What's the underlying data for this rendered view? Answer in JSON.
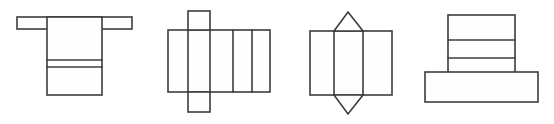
{
  "canvas": {
    "width": 554,
    "height": 124,
    "background_color": "#ffffff",
    "stroke_color": "#3c3c3c",
    "stroke_width": 1.6,
    "fill_color": "#fefefe",
    "description": "Row of four black-and-white line-drawn geometric nets (unfolded solids) on a plain white background. No text, labels, axes or numbers appear anywhere in the image."
  },
  "figures": [
    {
      "id": "figure-1",
      "name": "t-shaped-net",
      "label": "",
      "position_index": 1,
      "shape_type": "t-shape-net",
      "description": "A wide thin horizontal bar across the top with a tall vertical rectangle hanging from its middle, forming a T. The vertical rectangle is split by two closely spaced horizontal lines near its lower third.",
      "bounds": {
        "x": 17,
        "y": 17,
        "width": 115,
        "height": 79
      },
      "parts": [
        {
          "name": "top-horizontal-bar",
          "type": "rectangle",
          "x": 17,
          "y": 17,
          "width": 115,
          "height": 12
        },
        {
          "name": "vertical-body",
          "type": "rectangle",
          "x": 47,
          "y": 17,
          "width": 55,
          "height": 78
        }
      ],
      "divider_lines": [
        {
          "name": "body-divider-upper",
          "orientation": "horizontal",
          "x1": 47,
          "y1": 60,
          "x2": 102,
          "y2": 60
        },
        {
          "name": "body-divider-lower",
          "orientation": "horizontal",
          "x1": 47,
          "y1": 67,
          "x2": 102,
          "y2": 67
        }
      ]
    },
    {
      "id": "figure-2",
      "name": "box-net-with-flaps",
      "label": "",
      "position_index": 2,
      "shape_type": "rectangular-prism-net",
      "description": "A wide rectangle divided by four vertical lines into five panels, with one square flap projecting above and one square flap projecting below, both aligned with the second panel.",
      "bounds": {
        "x": 168,
        "y": 11,
        "width": 102,
        "height": 101
      },
      "parts": [
        {
          "name": "main-strip",
          "type": "rectangle",
          "x": 168,
          "y": 30,
          "width": 102,
          "height": 62
        },
        {
          "name": "top-flap-square",
          "type": "rectangle",
          "x": 188,
          "y": 11,
          "width": 22,
          "height": 19
        },
        {
          "name": "bottom-flap-square",
          "type": "rectangle",
          "x": 188,
          "y": 92,
          "width": 22,
          "height": 20
        }
      ],
      "divider_lines": [
        {
          "name": "strip-divider-1",
          "orientation": "vertical",
          "x1": 188,
          "y1": 30,
          "x2": 188,
          "y2": 92
        },
        {
          "name": "strip-divider-2",
          "orientation": "vertical",
          "x1": 210,
          "y1": 30,
          "x2": 210,
          "y2": 92
        },
        {
          "name": "strip-divider-3",
          "orientation": "vertical",
          "x1": 233,
          "y1": 30,
          "x2": 233,
          "y2": 92
        },
        {
          "name": "strip-divider-4",
          "orientation": "vertical",
          "x1": 252,
          "y1": 30,
          "x2": 252,
          "y2": 92
        }
      ]
    },
    {
      "id": "figure-3",
      "name": "prism-net-with-triangles",
      "label": "",
      "position_index": 3,
      "shape_type": "triangular-prism-net",
      "description": "A rectangle divided by two vertical lines into three panels, with a triangle pointing upward above the middle panel and a matching triangle pointing downward below it.",
      "bounds": {
        "x": 310,
        "y": 12,
        "width": 82,
        "height": 102
      },
      "parts": [
        {
          "name": "main-rectangle",
          "type": "rectangle",
          "x": 310,
          "y": 31,
          "width": 82,
          "height": 64
        },
        {
          "name": "top-triangle",
          "type": "triangle",
          "points": "334,31 348,12 363,31"
        },
        {
          "name": "bottom-triangle",
          "type": "triangle",
          "points": "334,95 348,114 363,95"
        }
      ],
      "divider_lines": [
        {
          "name": "rect-divider-left",
          "orientation": "vertical",
          "x1": 334,
          "y1": 31,
          "x2": 334,
          "y2": 95
        },
        {
          "name": "rect-divider-right",
          "orientation": "vertical",
          "x1": 363,
          "y1": 31,
          "x2": 363,
          "y2": 95
        }
      ]
    },
    {
      "id": "figure-4",
      "name": "inverted-t-net",
      "label": "",
      "position_index": 4,
      "shape_type": "inverted-t-shape-net",
      "description": "A tall vertical rectangle split by two horizontal lines into three stacked bands, sitting on a wide horizontal bar that extends past it on both sides, forming an upside-down T.",
      "bounds": {
        "x": 425,
        "y": 15,
        "width": 113,
        "height": 87
      },
      "parts": [
        {
          "name": "vertical-stack",
          "type": "rectangle",
          "x": 448,
          "y": 15,
          "width": 67,
          "height": 77
        },
        {
          "name": "bottom-horizontal-bar",
          "type": "rectangle",
          "x": 425,
          "y": 72,
          "width": 113,
          "height": 30
        }
      ],
      "divider_lines": [
        {
          "name": "stack-divider-upper",
          "orientation": "horizontal",
          "x1": 448,
          "y1": 40,
          "x2": 515,
          "y2": 40
        },
        {
          "name": "stack-divider-lower",
          "orientation": "horizontal",
          "x1": 448,
          "y1": 58,
          "x2": 515,
          "y2": 58
        }
      ]
    }
  ]
}
